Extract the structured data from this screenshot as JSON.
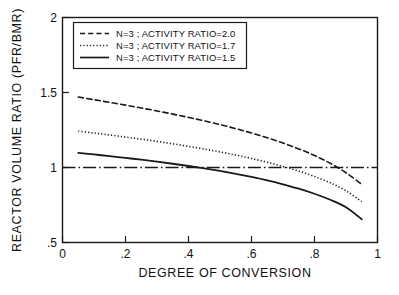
{
  "chart_data": {
    "type": "line",
    "title": "",
    "xlabel": "DEGREE OF CONVERSION",
    "ylabel": "REACTOR VOLUME RATIO (PFR/BMR)",
    "xlim": [
      0,
      1
    ],
    "ylim": [
      0.5,
      2
    ],
    "xticks": [
      "0",
      ".2",
      ".4",
      ".6",
      ".8",
      "1"
    ],
    "xtick_values": [
      0,
      0.2,
      0.4,
      0.6,
      0.8,
      1
    ],
    "yticks": [
      ".5",
      "1",
      "1.5",
      "2"
    ],
    "ytick_values": [
      0.5,
      1,
      1.5,
      2
    ],
    "grid": false,
    "legend_position": "upper-left-inset",
    "reference_line": {
      "name": "unity-reference",
      "orientation": "horizontal",
      "value": 1.0,
      "style": "dash-dot",
      "x_start": 0,
      "x_end": 1
    },
    "series": [
      {
        "name": "N=3 ; ACTIVITY RATIO=2.0",
        "style": "dashed",
        "color": "#1a1a1a",
        "x": [
          0.05,
          0.1,
          0.15,
          0.2,
          0.25,
          0.3,
          0.35,
          0.4,
          0.45,
          0.5,
          0.55,
          0.6,
          0.65,
          0.7,
          0.75,
          0.8,
          0.85,
          0.9,
          0.95
        ],
        "values": [
          1.47,
          1.452,
          1.434,
          1.416,
          1.397,
          1.377,
          1.356,
          1.334,
          1.311,
          1.286,
          1.259,
          1.23,
          1.198,
          1.163,
          1.124,
          1.08,
          1.028,
          0.965,
          0.888
        ]
      },
      {
        "name": "N=3 ; ACTIVITY RATIO=1.7",
        "style": "dotted",
        "color": "#1a1a1a",
        "x": [
          0.05,
          0.1,
          0.15,
          0.2,
          0.25,
          0.3,
          0.35,
          0.4,
          0.45,
          0.5,
          0.55,
          0.6,
          0.65,
          0.7,
          0.75,
          0.8,
          0.85,
          0.9,
          0.95
        ],
        "values": [
          1.243,
          1.23,
          1.217,
          1.203,
          1.189,
          1.174,
          1.158,
          1.141,
          1.123,
          1.104,
          1.083,
          1.06,
          1.035,
          1.007,
          0.976,
          0.94,
          0.898,
          0.845,
          0.772
        ]
      },
      {
        "name": "N=3 ; ACTIVITY RATIO=1.5",
        "style": "solid",
        "color": "#1a1a1a",
        "x": [
          0.05,
          0.1,
          0.15,
          0.2,
          0.25,
          0.3,
          0.35,
          0.4,
          0.45,
          0.5,
          0.55,
          0.6,
          0.65,
          0.7,
          0.75,
          0.8,
          0.85,
          0.9,
          0.95
        ],
        "values": [
          1.098,
          1.087,
          1.076,
          1.064,
          1.052,
          1.039,
          1.025,
          1.01,
          0.994,
          0.977,
          0.958,
          0.937,
          0.914,
          0.888,
          0.859,
          0.825,
          0.785,
          0.735,
          0.655
        ]
      }
    ]
  },
  "legend": {
    "entries": [
      {
        "label": "N=3 ; ACTIVITY RATIO=2.0",
        "style": "dashed"
      },
      {
        "label": "N=3 ; ACTIVITY RATIO=1.7",
        "style": "dotted"
      },
      {
        "label": "N=3 ; ACTIVITY RATIO=1.5",
        "style": "solid"
      }
    ]
  },
  "axes": {
    "x_title": "DEGREE OF CONVERSION",
    "y_title": "REACTOR VOLUME RATIO (PFR/BMR)",
    "x_tick_labels": [
      "0",
      ".2",
      ".4",
      ".6",
      ".8",
      "1"
    ],
    "y_tick_labels": [
      ".5",
      "1",
      "1.5",
      "2"
    ]
  }
}
